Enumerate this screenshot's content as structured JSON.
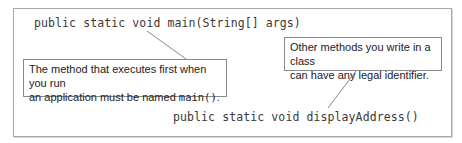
{
  "diagram": {
    "code_lines": [
      "public static void main(String[] args)",
      "public static void displayAddress()"
    ],
    "callouts": [
      {
        "line1": "The method that executes first when you run",
        "line2_prefix": "an application must be named ",
        "line2_code": "main()",
        "line2_suffix": ".",
        "points_to": "main"
      },
      {
        "line1": "Other methods you write in a class",
        "line2": "can have any legal identifier.",
        "points_to": "displayAddress"
      }
    ],
    "colors": {
      "frame_border": "#a8a8a8",
      "callout_border": "#8a8a8a",
      "code_text": "#3a3a3a",
      "leader_line": "#6a6a6a"
    }
  }
}
